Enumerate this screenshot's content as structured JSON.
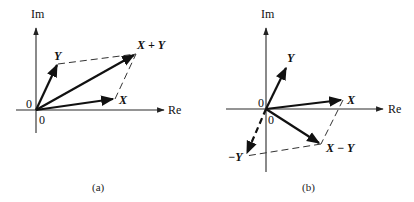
{
  "figure": {
    "panel_a": {
      "caption": "(a)",
      "axis_im": "Im",
      "axis_re": "Re",
      "origin_label_left": "0",
      "origin_label_below": "0",
      "vectors": {
        "x": "X",
        "y": "Y",
        "sum": "X + Y"
      }
    },
    "panel_b": {
      "caption": "(b)",
      "axis_im": "Im",
      "axis_re": "Re",
      "origin_label_left": "0",
      "origin_label_below": "0",
      "vectors": {
        "x": "X",
        "y": "Y",
        "neg_y": "−Y",
        "diff": "X − Y"
      }
    }
  }
}
